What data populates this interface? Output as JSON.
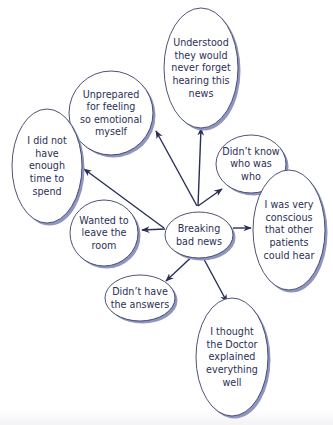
{
  "colors": {
    "ink": "#2b2f55",
    "outline": "#3b3f63",
    "shadow": "#8e95c0",
    "fill": "#ffffff",
    "arrow": "#2a2e58"
  },
  "diagram": {
    "center": {
      "id": "center",
      "lines": [
        "Breaking",
        "bad news"
      ]
    },
    "nodes": [
      {
        "id": "understood",
        "lines": [
          "Understood",
          "they would",
          "never forget",
          "hearing this",
          "news"
        ]
      },
      {
        "id": "unprepared",
        "lines": [
          "Unprepared",
          "for feeling",
          "so emotional",
          "myself"
        ]
      },
      {
        "id": "not-enough-time",
        "lines": [
          "I did not",
          "have",
          "enough",
          "time to",
          "spend"
        ]
      },
      {
        "id": "didnt-know",
        "lines": [
          "Didn’t know",
          "who was",
          "who"
        ]
      },
      {
        "id": "conscious",
        "lines": [
          "I was very",
          "conscious",
          "that other",
          "patients",
          "could hear"
        ]
      },
      {
        "id": "leave-room",
        "lines": [
          "Wanted to",
          "leave the",
          "room"
        ]
      },
      {
        "id": "no-answers",
        "lines": [
          "Didn’t have",
          "the answers"
        ]
      },
      {
        "id": "doctor-explained",
        "lines": [
          "I thought",
          "the Doctor",
          "explained",
          "everything",
          "well"
        ]
      }
    ],
    "edges": [
      {
        "from": "center",
        "to": "understood"
      },
      {
        "from": "center",
        "to": "unprepared"
      },
      {
        "from": "center",
        "to": "not-enough-time"
      },
      {
        "from": "center",
        "to": "didnt-know"
      },
      {
        "from": "center",
        "to": "conscious"
      },
      {
        "from": "center",
        "to": "leave-room"
      },
      {
        "from": "center",
        "to": "no-answers"
      },
      {
        "from": "center",
        "to": "doctor-explained"
      }
    ]
  }
}
